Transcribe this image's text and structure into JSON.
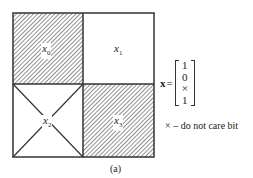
{
  "diagram": {
    "cells": [
      {
        "id": "x0",
        "var": "x",
        "sub": "0",
        "fill": "hatched"
      },
      {
        "id": "x1",
        "var": "x",
        "sub": "1",
        "fill": "white"
      },
      {
        "id": "x2",
        "var": "x",
        "sub": "2",
        "fill": "crossed"
      },
      {
        "id": "x3",
        "var": "x",
        "sub": "3",
        "fill": "hatched"
      }
    ],
    "vector": {
      "name": "x",
      "equals": "=",
      "entries": [
        "1",
        "0",
        "×",
        "1"
      ]
    },
    "legend": "× – do not care bit",
    "caption": "(a)"
  }
}
